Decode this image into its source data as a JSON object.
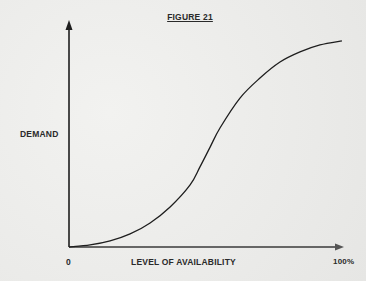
{
  "chart_data": {
    "type": "line",
    "title": "FIGURE 21",
    "xlabel": "LEVEL OF AVAILABILITY",
    "ylabel": "DEMAND",
    "x_tick_labels": {
      "start": "0",
      "end": "100%"
    },
    "xlim": [
      0,
      100
    ],
    "ylim": [
      0,
      1
    ],
    "grid": false,
    "legend": "none",
    "series": [
      {
        "name": "Demand curve",
        "x": [
          0,
          7.7,
          15,
          22.3,
          29.6,
          36.9,
          44.2,
          47.8,
          51.5,
          55.1,
          62.4,
          69.7,
          77,
          84.3,
          91.6,
          99.6
        ],
        "y": [
          0,
          0.009,
          0.027,
          0.058,
          0.107,
          0.178,
          0.276,
          0.356,
          0.444,
          0.529,
          0.662,
          0.751,
          0.822,
          0.867,
          0.898,
          0.916
        ]
      }
    ]
  },
  "colors": {
    "ink": "#1e1e1e",
    "paper": "#eeeeec"
  }
}
